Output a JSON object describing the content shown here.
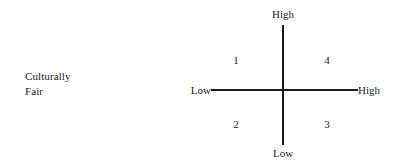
{
  "chart_data": {
    "type": "scatter",
    "title": "",
    "subtitle": "",
    "description_label": {
      "line1": "Culturally",
      "line2": "Fair"
    },
    "axes": {
      "vertical": {
        "high_label": "High",
        "low_label": "Low"
      },
      "horizontal": {
        "low_label": "Low",
        "high_label": "High"
      }
    },
    "quadrants": [
      {
        "id": "upper-left",
        "label": "1"
      },
      {
        "id": "upper-right",
        "label": "4"
      },
      {
        "id": "lower-left",
        "label": "2"
      },
      {
        "id": "lower-right",
        "label": "3"
      }
    ],
    "grid": false,
    "legend": false,
    "axis_color": "#1a1a1a",
    "background_color": "#ffffff"
  }
}
